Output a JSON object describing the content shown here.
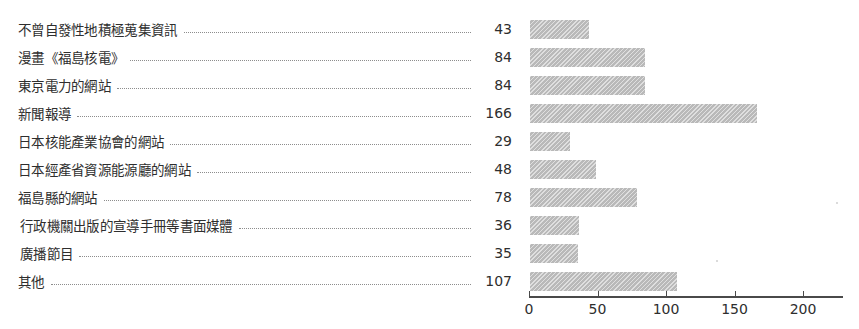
{
  "chart_data": {
    "type": "bar",
    "orientation": "horizontal",
    "title": "",
    "xlabel": "",
    "ylabel": "",
    "xlim": [
      0,
      230
    ],
    "xticks": [
      0,
      50,
      100,
      150,
      200
    ],
    "xtick_labels": [
      "0",
      "50",
      "100",
      "150",
      "200"
    ],
    "grid": false,
    "legend": false,
    "bar_color": "#b9b9b9",
    "bar_hatch": "diagonal-lines",
    "categories": [
      "不曾自發性地積極蒐集資訊",
      "漫畫《福島核電》",
      "東京電力的網站",
      "新聞報導",
      "日本核能產業協會的網站",
      "日本經產省資源能源廳的網站",
      "福島縣的網站",
      "行政機關出版的宣導手冊等書面媒體",
      "廣播節目",
      "其他"
    ],
    "values": [
      43,
      84,
      84,
      166,
      29,
      48,
      78,
      36,
      35,
      107
    ],
    "value_labels": [
      "43",
      "84",
      "84",
      "166",
      "29",
      "48",
      "78",
      "36",
      "35",
      "107"
    ]
  }
}
